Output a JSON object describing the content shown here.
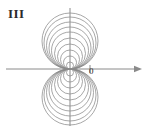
{
  "figure": {
    "panel_label": "III",
    "origin_label": "0",
    "caption": "",
    "stroke_color": "#8a8a8a",
    "axis_color": "#8a8a8a",
    "text_color": "#2b2b2b",
    "background_color": "#ffffff"
  },
  "chart_data": {
    "type": "line",
    "title": "III",
    "subtitle": "",
    "xlabel": "",
    "ylabel": "",
    "grid": false,
    "legend": false,
    "legend_position": "none",
    "axes": {
      "x_axis": {
        "visible": true,
        "y_pixel": 69,
        "x_start_pixel": 6,
        "x_end_pixel": 142,
        "arrow_end": "right",
        "arrow_start": "none"
      },
      "y_axis": {
        "visible": true,
        "x_pixel": 70,
        "y_start_pixel": 8,
        "y_end_pixel": 126,
        "arrow_end": "none",
        "arrow_start": "none"
      },
      "origin_pixel": [
        70,
        69
      ],
      "xlim": [
        -64,
        72
      ],
      "ylim": [
        -57,
        61
      ]
    },
    "ticks": [
      {
        "axis": "x",
        "x_pixel": 90,
        "label": ""
      }
    ],
    "annotations": [
      {
        "text": "III",
        "x_pixel": 8,
        "y_pixel": 6,
        "anchor": "top-left"
      },
      {
        "text": "0",
        "x_pixel": 89,
        "y_pixel": 66,
        "anchor": "top-left"
      }
    ],
    "series": [
      {
        "name": "upper-lobe-circles",
        "shape": "circle-family",
        "tangent_point_pixel": [
          70,
          69
        ],
        "direction": "up",
        "count": 10,
        "center_x_pixel": 70,
        "diameters_pixel": [
          7,
          13,
          19,
          25,
          31,
          37,
          42,
          47,
          52,
          56
        ],
        "centers_y_pixel": [
          65.5,
          62.5,
          59.5,
          56.5,
          53.5,
          50.5,
          48.0,
          45.5,
          43.0,
          41.0
        ],
        "radii_pixel": [
          3.5,
          6.5,
          9.5,
          12.5,
          15.5,
          18.5,
          21.0,
          23.5,
          26.0,
          28.0
        ]
      },
      {
        "name": "lower-lobe-circles",
        "shape": "circle-family",
        "tangent_point_pixel": [
          70,
          69
        ],
        "direction": "down",
        "count": 10,
        "center_x_pixel": 70,
        "diameters_pixel": [
          7,
          13,
          19,
          25,
          31,
          37,
          42,
          47,
          52,
          56
        ],
        "centers_y_pixel": [
          72.5,
          75.5,
          78.5,
          81.5,
          84.5,
          87.5,
          90.0,
          92.5,
          95.0,
          97.0
        ],
        "radii_pixel": [
          3.5,
          6.5,
          9.5,
          12.5,
          15.5,
          18.5,
          21.0,
          23.5,
          26.0,
          28.0
        ]
      }
    ]
  }
}
